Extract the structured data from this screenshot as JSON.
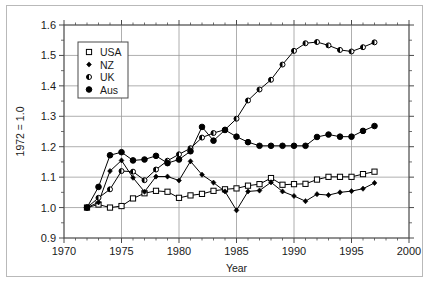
{
  "chart_data": {
    "type": "line",
    "title": "",
    "xlabel": "Year",
    "ylabel": "1972 = 1.0",
    "xlim": [
      1970,
      2000
    ],
    "ylim": [
      0.9,
      1.6
    ],
    "xticks": [
      1970,
      1975,
      1980,
      1985,
      1990,
      1995,
      2000
    ],
    "xticklabels": [
      "1970",
      "1975",
      "1980",
      "1985",
      "1990",
      "1995",
      "2000"
    ],
    "yticks": [
      0.9,
      1.0,
      1.1,
      1.2,
      1.3,
      1.4,
      1.5,
      1.6
    ],
    "yticklabels": [
      "0.9",
      "1.0",
      "1.1",
      "1.2",
      "1.3",
      "1.4",
      "1.5",
      "1.6"
    ],
    "x_minor_step": 1,
    "y_minor_step": 0.05,
    "grid": true,
    "grid_axis": "both",
    "legend_position": "upper left inside",
    "x": [
      1972,
      1973,
      1974,
      1975,
      1976,
      1977,
      1978,
      1979,
      1980,
      1981,
      1982,
      1983,
      1984,
      1985,
      1986,
      1987,
      1988,
      1989,
      1990,
      1991,
      1992,
      1993,
      1994,
      1995,
      1996,
      1997
    ],
    "series": [
      {
        "name": "USA",
        "marker": "open-square",
        "values": [
          1.0,
          1.01,
          1.0,
          1.005,
          1.03,
          1.047,
          1.055,
          1.052,
          1.032,
          1.04,
          1.045,
          1.055,
          1.06,
          1.063,
          1.072,
          1.077,
          1.097,
          1.075,
          1.077,
          1.078,
          1.092,
          1.101,
          1.101,
          1.101,
          1.11,
          1.118
        ]
      },
      {
        "name": "NZ",
        "marker": "small-filled-diamond",
        "values": [
          1.0,
          1.017,
          1.12,
          1.155,
          1.098,
          1.052,
          1.102,
          1.102,
          1.089,
          1.152,
          1.108,
          1.082,
          1.053,
          0.991,
          1.053,
          1.056,
          1.083,
          1.053,
          1.038,
          1.021,
          1.044,
          1.041,
          1.05,
          1.054,
          1.062,
          1.081
        ]
      },
      {
        "name": "UK",
        "marker": "half-filled-circle",
        "values": [
          1.0,
          1.032,
          1.06,
          1.12,
          1.118,
          1.09,
          1.125,
          1.154,
          1.175,
          1.195,
          1.23,
          1.245,
          1.256,
          1.292,
          1.352,
          1.388,
          1.42,
          1.47,
          1.515,
          1.54,
          1.544,
          1.533,
          1.518,
          1.513,
          1.527,
          1.543
        ]
      },
      {
        "name": "Aus",
        "marker": "filled-circle",
        "values": [
          1.0,
          1.068,
          1.172,
          1.182,
          1.155,
          1.158,
          1.17,
          1.146,
          1.158,
          1.185,
          1.265,
          1.22,
          1.255,
          1.233,
          1.215,
          1.203,
          1.203,
          1.203,
          1.203,
          1.203,
          1.232,
          1.24,
          1.233,
          1.233,
          1.252,
          1.268
        ]
      }
    ]
  },
  "legend": {
    "entries": [
      {
        "label": "USA"
      },
      {
        "label": "NZ"
      },
      {
        "label": "UK"
      },
      {
        "label": "Aus"
      }
    ]
  },
  "colors": {
    "series": "#000000",
    "grid": "#9a9a9a",
    "axis": "#4a4a4a",
    "text": "#1a1a1a",
    "background": "#ffffff",
    "frame": "#b9b9b9"
  }
}
